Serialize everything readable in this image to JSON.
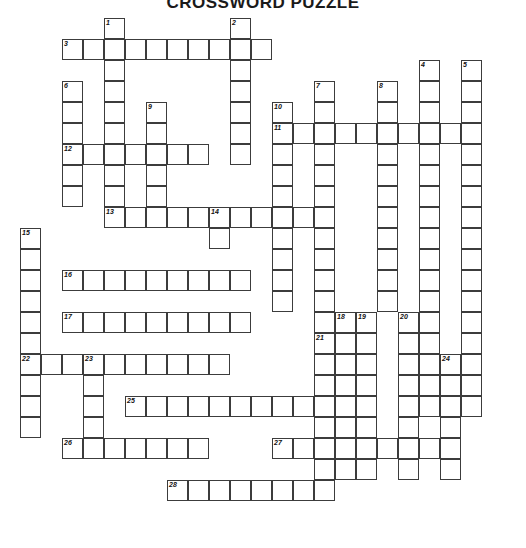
{
  "title": "CROSSWORD PUZZLE",
  "grid": {
    "cell_size": 21,
    "origin_x": 20,
    "origin_y": 18,
    "columns": 24,
    "rows": 25,
    "line_color": "#3c3c3c",
    "cell_fill": "#ffffff",
    "page_background": "#ffffff"
  },
  "clue_numbers": [
    {
      "n": "1",
      "col": 4,
      "row": 0
    },
    {
      "n": "2",
      "col": 10,
      "row": 0
    },
    {
      "n": "3",
      "col": 2,
      "row": 1
    },
    {
      "n": "4",
      "col": 19,
      "row": 2
    },
    {
      "n": "5",
      "col": 21,
      "row": 2
    },
    {
      "n": "6",
      "col": 2,
      "row": 3
    },
    {
      "n": "7",
      "col": 14,
      "row": 3
    },
    {
      "n": "8",
      "col": 17,
      "row": 3
    },
    {
      "n": "9",
      "col": 6,
      "row": 4
    },
    {
      "n": "10",
      "col": 12,
      "row": 4
    },
    {
      "n": "11",
      "col": 12,
      "row": 5
    },
    {
      "n": "12",
      "col": 2,
      "row": 6
    },
    {
      "n": "13",
      "col": 4,
      "row": 9
    },
    {
      "n": "14",
      "col": 9,
      "row": 9
    },
    {
      "n": "15",
      "col": 0,
      "row": 10
    },
    {
      "n": "16",
      "col": 2,
      "row": 12
    },
    {
      "n": "17",
      "col": 2,
      "row": 14
    },
    {
      "n": "18",
      "col": 15,
      "row": 14
    },
    {
      "n": "19",
      "col": 16,
      "row": 14
    },
    {
      "n": "20",
      "col": 18,
      "row": 14
    },
    {
      "n": "21",
      "col": 14,
      "row": 15
    },
    {
      "n": "22",
      "col": 0,
      "row": 16
    },
    {
      "n": "23",
      "col": 3,
      "row": 16
    },
    {
      "n": "24",
      "col": 20,
      "row": 16
    },
    {
      "n": "25",
      "col": 5,
      "row": 18
    },
    {
      "n": "26",
      "col": 2,
      "row": 20
    },
    {
      "n": "27",
      "col": 12,
      "row": 20
    },
    {
      "n": "28",
      "col": 7,
      "row": 22
    }
  ],
  "entries": [
    {
      "name": "entry-1-down",
      "number": "1",
      "dir": "down",
      "col": 4,
      "row": 0,
      "length": 10
    },
    {
      "name": "entry-2-down",
      "number": "2",
      "dir": "down",
      "col": 10,
      "row": 0,
      "length": 7
    },
    {
      "name": "entry-3-across",
      "number": "3",
      "dir": "across",
      "col": 2,
      "row": 1,
      "length": 10
    },
    {
      "name": "entry-4-down",
      "number": "4",
      "dir": "down",
      "col": 19,
      "row": 2,
      "length": 17
    },
    {
      "name": "entry-5-down",
      "number": "5",
      "dir": "down",
      "col": 21,
      "row": 2,
      "length": 17
    },
    {
      "name": "entry-6-down",
      "number": "6",
      "dir": "down",
      "col": 2,
      "row": 3,
      "length": 6
    },
    {
      "name": "entry-7-down",
      "number": "7",
      "dir": "down",
      "col": 14,
      "row": 3,
      "length": 12
    },
    {
      "name": "entry-8-down",
      "number": "8",
      "dir": "down",
      "col": 17,
      "row": 3,
      "length": 11
    },
    {
      "name": "entry-9-down",
      "number": "9",
      "dir": "down",
      "col": 6,
      "row": 4,
      "length": 6
    },
    {
      "name": "entry-10-down",
      "number": "10",
      "dir": "down",
      "col": 12,
      "row": 4,
      "length": 10
    },
    {
      "name": "entry-11-across",
      "number": "11",
      "dir": "across",
      "col": 12,
      "row": 5,
      "length": 10
    },
    {
      "name": "entry-12-across",
      "number": "12",
      "dir": "across",
      "col": 2,
      "row": 6,
      "length": 7
    },
    {
      "name": "entry-13-across",
      "number": "13",
      "dir": "across",
      "col": 4,
      "row": 9,
      "length": 11
    },
    {
      "name": "entry-14-down",
      "number": "14",
      "dir": "down",
      "col": 9,
      "row": 9,
      "length": 2
    },
    {
      "name": "entry-15-down",
      "number": "15",
      "dir": "down",
      "col": 0,
      "row": 10,
      "length": 10
    },
    {
      "name": "entry-16-across",
      "number": "16",
      "dir": "across",
      "col": 2,
      "row": 12,
      "length": 9
    },
    {
      "name": "entry-17-across",
      "number": "17",
      "dir": "across",
      "col": 2,
      "row": 14,
      "length": 9
    },
    {
      "name": "entry-18-down",
      "number": "18",
      "dir": "down",
      "col": 15,
      "row": 14,
      "length": 8
    },
    {
      "name": "entry-19-down",
      "number": "19",
      "dir": "down",
      "col": 16,
      "row": 14,
      "length": 8
    },
    {
      "name": "entry-20-down",
      "number": "20",
      "dir": "down",
      "col": 18,
      "row": 14,
      "length": 8
    },
    {
      "name": "entry-21-down",
      "number": "21",
      "dir": "down",
      "col": 14,
      "row": 15,
      "length": 7
    },
    {
      "name": "entry-22-across",
      "number": "22",
      "dir": "across",
      "col": 0,
      "row": 16,
      "length": 10
    },
    {
      "name": "entry-23-down",
      "number": "23",
      "dir": "down",
      "col": 3,
      "row": 16,
      "length": 5
    },
    {
      "name": "entry-24-down",
      "number": "24",
      "dir": "down",
      "col": 20,
      "row": 16,
      "length": 6
    },
    {
      "name": "entry-25-across",
      "number": "25",
      "dir": "across",
      "col": 5,
      "row": 18,
      "length": 10
    },
    {
      "name": "entry-26-across",
      "number": "26",
      "dir": "across",
      "col": 2,
      "row": 20,
      "length": 7
    },
    {
      "name": "entry-27-across",
      "number": "27",
      "dir": "across",
      "col": 12,
      "row": 20,
      "length": 9
    },
    {
      "name": "entry-28-across",
      "number": "28",
      "dir": "across",
      "col": 7,
      "row": 22,
      "length": 8
    }
  ]
}
